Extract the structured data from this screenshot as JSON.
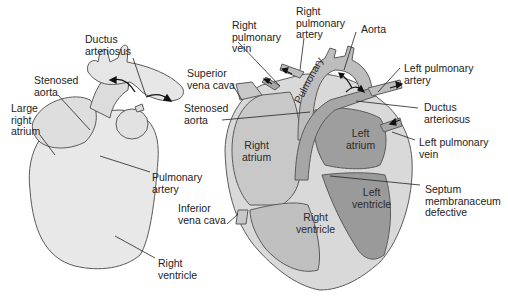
{
  "diagram": {
    "left_heart": {
      "labels": [
        {
          "id": "ductus_arteriosus",
          "text": "Ductus\narteriosus"
        },
        {
          "id": "stenosed_aorta",
          "text": "Stenosed\naorta"
        },
        {
          "id": "large_right_atrium",
          "text": "Large\nright\natrium"
        },
        {
          "id": "pulmonary_artery",
          "text": "Pulmonary\nartery"
        },
        {
          "id": "right_ventricle",
          "text": "Right\nventricle"
        }
      ]
    },
    "right_heart": {
      "outer_labels": [
        {
          "id": "right_pulmonary_vein",
          "text": "Right\npulmonary\nvein"
        },
        {
          "id": "right_pulmonary_artery",
          "text": "Right\npulmonary\nartery"
        },
        {
          "id": "aorta",
          "text": "Aorta"
        },
        {
          "id": "superior_vena_cava",
          "text": "Superior\nvena cava"
        },
        {
          "id": "left_pulmonary_artery",
          "text": "Left pulmonary\nartery"
        },
        {
          "id": "stenosed_aorta",
          "text": "Stenosed\naorta"
        },
        {
          "id": "ductus_arteriosus",
          "text": "Ductus\narteriosus"
        },
        {
          "id": "left_pulmonary_vein",
          "text": "Left pulmonary\nvein"
        },
        {
          "id": "inferior_vena_cava",
          "text": "Inferior\nvena cava"
        },
        {
          "id": "septum_membranaceum_defective",
          "text": "Septum\nmembranaceum\ndefective"
        }
      ],
      "inner_labels": [
        {
          "id": "pulmonary",
          "text": "Pulmonary"
        },
        {
          "id": "right_atrium",
          "text": "Right\natrium"
        },
        {
          "id": "left_atrium",
          "text": "Left\natrium"
        },
        {
          "id": "left_ventricle",
          "text": "Left\nventricle"
        },
        {
          "id": "right_ventricle",
          "text": "Right\nventricle"
        }
      ]
    },
    "colors": {
      "outline": "#5a5a5a",
      "light_fill": "#e6e6e6",
      "mid_fill": "#c4c4c4",
      "dark_fill": "#9a9a9a",
      "wall_fill": "#dadada",
      "text": "#222222"
    }
  }
}
